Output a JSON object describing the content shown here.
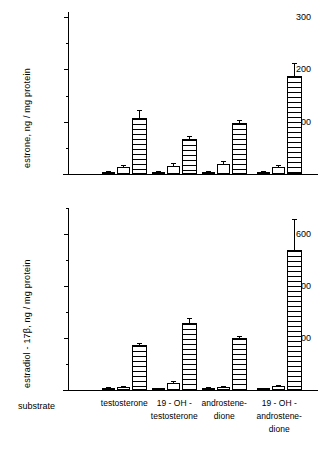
{
  "figure": {
    "substrate_label": "substrate"
  },
  "chart_data": [
    {
      "type": "bar",
      "panel": "top",
      "title": "",
      "xlabel": "substrate",
      "ylabel": "estrone, ng / mg protein",
      "ylim": [
        0,
        310
      ],
      "yticks": [
        100,
        200,
        300
      ],
      "yticklabels": [
        "100",
        "200",
        "300"
      ],
      "yminorticks": [
        50,
        150,
        250
      ],
      "grid": false,
      "legend": "none",
      "categories": [
        "testosterone",
        "19-OH-testosterone",
        "androstenedione",
        "19-OH-androstenedione"
      ],
      "series": [
        {
          "name": "bar-1",
          "values": [
            4,
            3,
            4,
            4
          ],
          "errors": [
            2,
            2,
            2,
            2
          ]
        },
        {
          "name": "bar-2",
          "values": [
            14,
            16,
            19,
            14
          ],
          "errors": [
            4,
            5,
            5,
            4
          ]
        },
        {
          "name": "bar-3",
          "values": [
            108,
            67,
            97,
            188
          ],
          "errors": [
            14,
            5,
            7,
            24
          ]
        }
      ]
    },
    {
      "type": "bar",
      "panel": "bottom",
      "title": "",
      "xlabel": "substrate",
      "ylabel": "estradiol - 17β, ng / mg protein",
      "ylim": [
        0,
        700
      ],
      "yticks": [
        200,
        400,
        600
      ],
      "yticklabels": [
        "200",
        "400",
        "600"
      ],
      "yminorticks": [
        100,
        300,
        500,
        700
      ],
      "grid": false,
      "legend": "none",
      "categories": [
        "testosterone",
        "19-OH-testosterone",
        "androstenedione",
        "19-OH-androstenedione"
      ],
      "series": [
        {
          "name": "bar-1",
          "values": [
            9,
            5,
            7,
            6
          ],
          "errors": [
            4,
            3,
            3,
            3
          ]
        },
        {
          "name": "bar-2",
          "values": [
            11,
            26,
            10,
            15
          ],
          "errors": [
            5,
            9,
            4,
            6
          ]
        },
        {
          "name": "bar-3",
          "values": [
            172,
            258,
            199,
            537
          ],
          "errors": [
            9,
            18,
            7,
            122
          ]
        }
      ]
    }
  ],
  "xaxis": {
    "labels": [
      {
        "line1": "testosterone",
        "line2": "",
        "line3": ""
      },
      {
        "line1": "19 - OH -",
        "line2": "testosterone",
        "line3": ""
      },
      {
        "line1": "androstene-",
        "line2": "dione",
        "line3": ""
      },
      {
        "line1": "19 - OH -",
        "line2": "androstene-",
        "line3": "dione"
      }
    ]
  }
}
